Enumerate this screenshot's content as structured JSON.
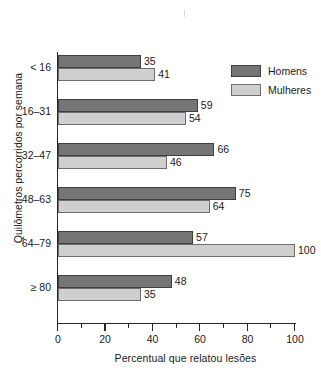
{
  "chart_data": {
    "type": "bar",
    "orientation": "horizontal",
    "title": "",
    "xlabel": "Percentual que relatou lesões",
    "ylabel": "Quilômetros percorridos por semana",
    "categories": [
      "< 16",
      "16–31",
      "32–47",
      "48–63",
      "64–79",
      "≥ 80"
    ],
    "series": [
      {
        "name": "Homens",
        "color": "#757575",
        "values": [
          35,
          59,
          66,
          75,
          57,
          48
        ]
      },
      {
        "name": "Mulheres",
        "color": "#cfcfcf",
        "values": [
          41,
          54,
          46,
          64,
          100,
          35
        ]
      }
    ],
    "xlim": [
      0,
      100
    ],
    "xticks": [
      0,
      20,
      40,
      60,
      80,
      100
    ],
    "xticks_minor": [
      10,
      30,
      50,
      70,
      90
    ],
    "xtick_labels": [
      "0",
      "20",
      "40",
      "60",
      "80",
      "100"
    ],
    "grid": false,
    "legend_position": "top-right",
    "legend_entries": [
      "Homens",
      "Mulheres"
    ]
  },
  "axis": {
    "x_label": "Percentual que relatou lesões",
    "y_label": "Quilômetros percorridos por semana"
  },
  "legend": {
    "items": [
      {
        "label": "Homens"
      },
      {
        "label": "Mulheres"
      }
    ]
  },
  "bar_labels": {
    "g0_men": "35",
    "g0_women": "41",
    "g1_men": "59",
    "g1_women": "54",
    "g2_men": "66",
    "g2_women": "46",
    "g3_men": "75",
    "g3_women": "64",
    "g4_men": "57",
    "g4_women": "100",
    "g5_men": "48",
    "g5_women": "35"
  },
  "categories": {
    "c0": "< 16",
    "c1": "16–31",
    "c2": "32–47",
    "c3": "48–63",
    "c4": "64–79",
    "c5": "≥ 80"
  },
  "xticks": {
    "t0": "0",
    "t1": "20",
    "t2": "40",
    "t3": "60",
    "t4": "80",
    "t5": "100"
  }
}
